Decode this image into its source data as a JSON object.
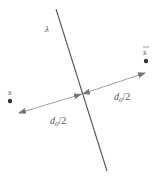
{
  "diagram": {
    "labels": {
      "line": "λ",
      "point_left": "s",
      "point_right": "s",
      "dist_left": "d",
      "dist_left_sub": "0",
      "dist_left_tail": "/2",
      "dist_right": "d",
      "dist_right_sub": "0",
      "dist_right_tail": "/2"
    },
    "colors": {
      "line": "#555555",
      "arrow": "#777777",
      "point": "#333333",
      "text": "#555555"
    }
  }
}
